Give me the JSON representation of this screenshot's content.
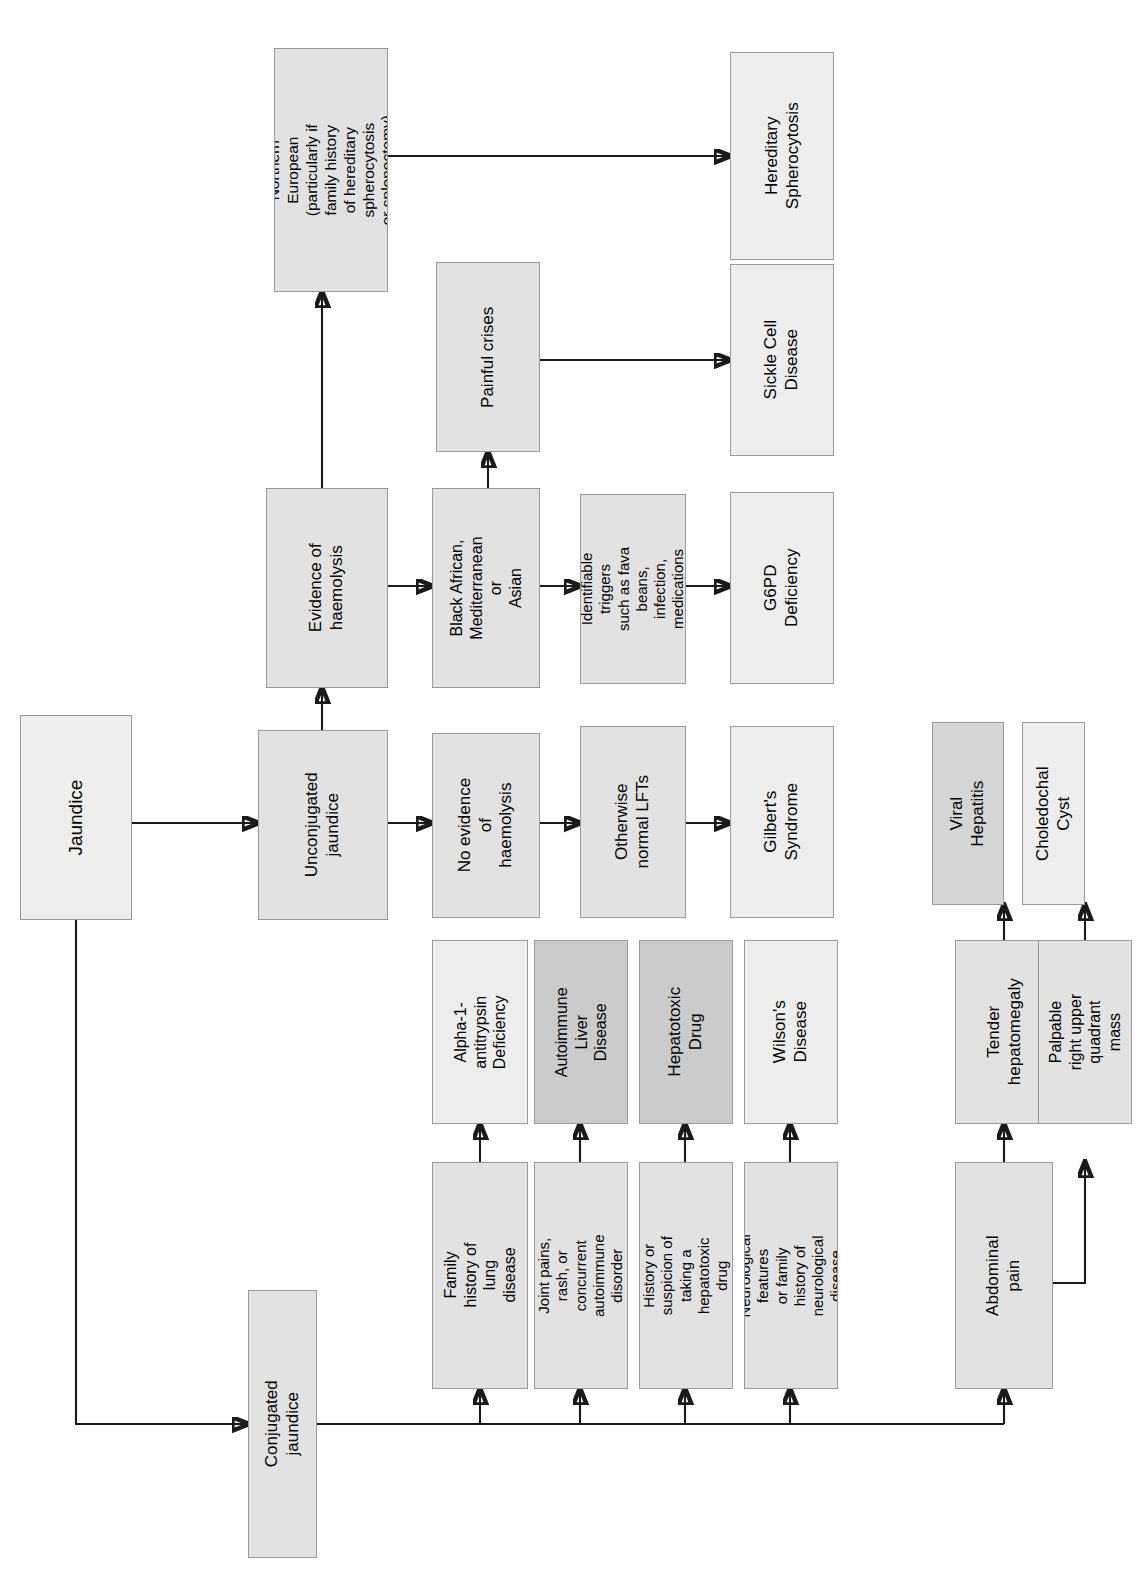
{
  "diagram": {
    "orientation": "rotated-90-ccw",
    "palette": {
      "background": "#ffffff",
      "box_border": "#9a9a9a",
      "connector": "#1a1a1a",
      "shade_light": "#eeeeee",
      "shade_mid": "#e2e2e2",
      "shade_dark": "#d5d5d5",
      "shade_darker": "#cbcbcb"
    }
  },
  "nodes": {
    "jaundice": "Jaundice",
    "unconjugated_jaundice": "Unconjugated\njaundice",
    "conjugated_jaundice": "Conjugated jaundice",
    "evidence_of_haemolysis": "Evidence of\nhaemolysis",
    "no_evidence_of_haemolysis": "No evidence of\nhaemolysis",
    "northern_european": "Northern European\n(particularly if family history\nof hereditary spherocytosis\nor splenectomy)",
    "black_african": "Black African,\nMediterranean or\nAsian",
    "painful_crises": "Painful crises",
    "identifiable_triggers": "Identifiable triggers\nsuch as fava beans,\ninfection, medications",
    "otherwise_normal_lfts": "Otherwise\nnormal LFTs",
    "hereditary_spherocytosis": "Hereditary\nSpherocytosis",
    "sickle_cell_disease": "Sickle Cell Disease",
    "g6pd_deficiency": "G6PD Deficiency",
    "gilberts_syndrome": "Gilbert's Syndrome",
    "family_history_lung_disease": "Family history of lung\ndisease",
    "joint_pains_rash": "Joint pains, rash, or\nconcurrent\nautoimmune disorder",
    "history_hepatotoxic_drug": "History or suspicion of\ntaking a hepatotoxic\ndrug",
    "neurological_features": "Neurological features\nor family history of\nneurological disease",
    "abdominal_pain": "Abdominal pain",
    "alpha_1_antitrypsin_deficiency": "Alpha-1-antitrypsin\nDeficiency",
    "autoimmune_liver_disease": "Autoimmune Liver\nDisease",
    "hepatotoxic_drug": "Hepatotoxic Drug",
    "wilsons_disease": "Wilson's Disease",
    "tender_hepatomegaly": "Tender hepatomegaly",
    "palpable_ruq_mass": "Palpable right upper\nquadrant mass",
    "viral_hepatitis": "Viral Hepatitis",
    "choledochal_cyst": "Choledochal Cyst"
  }
}
